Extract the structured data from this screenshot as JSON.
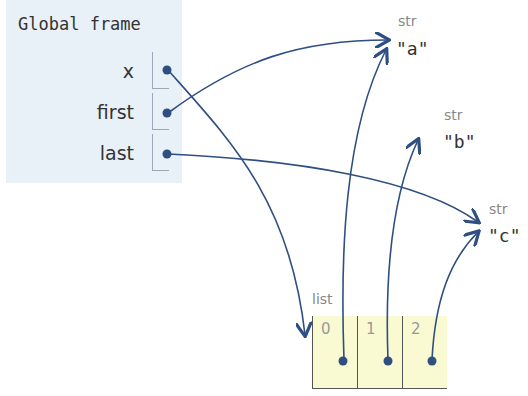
{
  "frame": {
    "title": "Global frame",
    "variables": [
      {
        "name": "x",
        "points_to": "list"
      },
      {
        "name": "first",
        "points_to": "a"
      },
      {
        "name": "last",
        "points_to": "c"
      }
    ]
  },
  "objects": {
    "a": {
      "type": "str",
      "value": "\"a\""
    },
    "b": {
      "type": "str",
      "value": "\"b\""
    },
    "c": {
      "type": "str",
      "value": "\"c\""
    },
    "list": {
      "type": "list",
      "indices": [
        "0",
        "1",
        "2"
      ],
      "points_to": [
        "a",
        "b",
        "c"
      ]
    }
  },
  "colors": {
    "arrow": "#2f4f80",
    "frame_bg": "#e8f0f8",
    "list_bg": "#fafad2"
  }
}
